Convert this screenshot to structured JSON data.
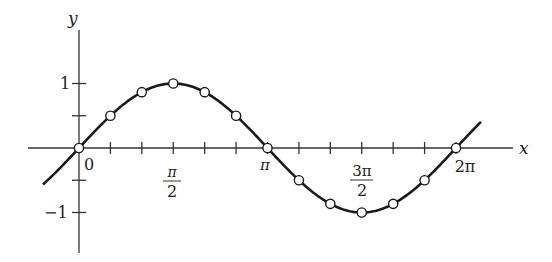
{
  "chart_data": {
    "type": "line",
    "title": "",
    "function": "y = sin x",
    "xlabel": "x",
    "ylabel": "y",
    "xlim": [
      -0.6,
      7.25
    ],
    "ylim": [
      -1.6,
      1.8
    ],
    "grid": false,
    "legend": null,
    "x_tick_step": "π/6",
    "x_tick_labels": [
      {
        "value": 0,
        "label": "0"
      },
      {
        "value": 1.5708,
        "label_num": "π",
        "label_den": "2"
      },
      {
        "value": 3.1416,
        "label": "π"
      },
      {
        "value": 4.7124,
        "label_num": "3π",
        "label_den": "2"
      },
      {
        "value": 6.2832,
        "label": "2π"
      }
    ],
    "y_ticks": [
      -1,
      -0.5,
      0.5,
      1
    ],
    "y_tick_labels": [
      {
        "value": 1,
        "label": "1"
      },
      {
        "value": -1,
        "label": "−1"
      }
    ],
    "series": [
      {
        "name": "sin x",
        "curve_range": [
          -0.6,
          6.7
        ],
        "markers": "open-circle",
        "x": [
          "0",
          "π/6",
          "π/3",
          "π/2",
          "2π/3",
          "5π/6",
          "π",
          "7π/6",
          "4π/3",
          "3π/2",
          "5π/3",
          "11π/6",
          "2π"
        ],
        "x_values": [
          0,
          0.5236,
          1.0472,
          1.5708,
          2.0944,
          2.618,
          3.1416,
          3.6652,
          4.1888,
          4.7124,
          5.236,
          5.7596,
          6.2832
        ],
        "values": [
          0,
          0.5,
          0.866,
          1,
          0.866,
          0.5,
          0,
          -0.5,
          -0.866,
          -1,
          -0.866,
          -0.5,
          0
        ]
      }
    ]
  },
  "labels": {
    "x_axis": "x",
    "y_axis": "y",
    "zero": "0",
    "one": "1",
    "minus_one": "−1",
    "pi_half_num": "π",
    "pi_half_den": "2",
    "pi": "π",
    "three_pi_half_num": "3π",
    "three_pi_half_den": "2",
    "two_pi": "2π"
  }
}
